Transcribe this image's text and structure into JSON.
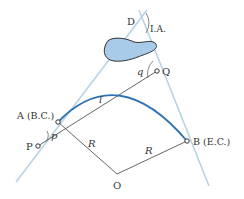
{
  "diagram": {
    "labels": {
      "D": "D",
      "IA": "I.A.",
      "q": "q",
      "Q": "Q",
      "l": "l",
      "A": "A (B.C.)",
      "p": "p",
      "P": "P",
      "R_left": "R",
      "R_right": "R",
      "B": "B (E.C.)",
      "O": "O"
    },
    "colors": {
      "tangent": "#b7d3e6",
      "arc": "#2f73b5",
      "blob_fill": "#a9cbea",
      "blob_stroke": "#333333",
      "line": "#555555",
      "text": "#333333"
    }
  }
}
